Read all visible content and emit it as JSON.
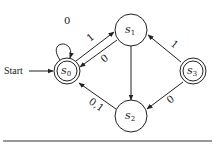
{
  "diagram": {
    "type": "finite-state-machine",
    "start_label": "Start",
    "states": [
      {
        "id": "s0",
        "label": "s",
        "sub": "0",
        "accepting": true,
        "start": true
      },
      {
        "id": "s1",
        "label": "s",
        "sub": "1",
        "accepting": false
      },
      {
        "id": "s2",
        "label": "s",
        "sub": "2",
        "accepting": false
      },
      {
        "id": "s3",
        "label": "s",
        "sub": "3",
        "accepting": true
      }
    ],
    "transitions": [
      {
        "from": "s0",
        "to": "s0",
        "label": "0"
      },
      {
        "from": "s0",
        "to": "s1",
        "label": "1"
      },
      {
        "from": "s1",
        "to": "s0",
        "label": "0"
      },
      {
        "from": "s1",
        "to": "s2",
        "label": ""
      },
      {
        "from": "s2",
        "to": "s0",
        "label": "0,1"
      },
      {
        "from": "s3",
        "to": "s1",
        "label": "1"
      },
      {
        "from": "s3",
        "to": "s2",
        "label": "0"
      }
    ]
  }
}
